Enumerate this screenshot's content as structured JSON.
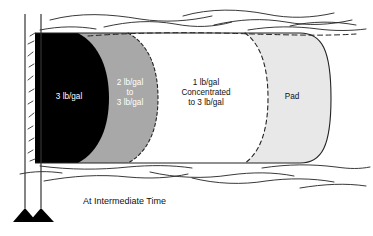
{
  "figure": {
    "caption": "At Intermediate Time",
    "zones": [
      {
        "id": "slurry-3-lbgal",
        "label": "3 lb/gal",
        "fill": "#000000",
        "text_color": "#ffffff"
      },
      {
        "id": "slurry-2-to-3-lbgal",
        "label": "2 lb/gal\nto\n3 lb/gal",
        "fill": "#a8a8a8",
        "text_color": "#ffffff"
      },
      {
        "id": "slurry-1-concentrated",
        "label": "1 lb/gal\nConcentrated\nto 3 lb/gal",
        "fill": "#ffffff",
        "text_color": "#111111"
      },
      {
        "id": "pad",
        "label": "Pad",
        "fill": "#e8e8e8",
        "text_color": "#111111"
      }
    ],
    "wellbore": {
      "name": "wellbore-casing",
      "line_color": "#333333",
      "foot_color": "#000000"
    },
    "formation": {
      "name": "rock-strata",
      "line_color": "#222222"
    },
    "outline_color": "#222222",
    "dashed_color": "#222222",
    "background": "#ffffff"
  }
}
